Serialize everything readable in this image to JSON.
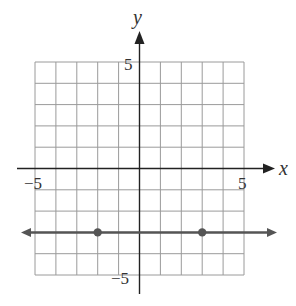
{
  "chart_data": {
    "type": "line",
    "title": "",
    "xlabel": "x",
    "ylabel": "y",
    "xlim": [
      -5,
      5
    ],
    "ylim": [
      -5,
      5
    ],
    "grid": true,
    "tick_labels": {
      "x_min": "−5",
      "x_max": "5",
      "y_max": "5",
      "y_min": "−5"
    },
    "series": [
      {
        "name": "horizontal line y = -3",
        "equation": "y = -3",
        "extends_both_directions": true,
        "points": [
          {
            "x": -2,
            "y": -3
          },
          {
            "x": 3,
            "y": -3
          }
        ]
      }
    ]
  },
  "colors": {
    "grid": "#9a9a9a",
    "axis": "#222222",
    "line": "#555555",
    "point": "#555555"
  }
}
